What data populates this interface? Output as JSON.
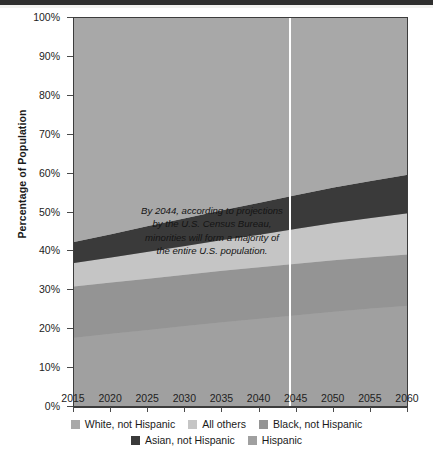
{
  "chart_data": {
    "type": "area",
    "title": "",
    "subtitle": "",
    "xlabel": "",
    "ylabel": "Percentage of Population",
    "xlim": [
      2015,
      2060
    ],
    "ylim": [
      0,
      100
    ],
    "stacked": true,
    "stack_order_top_to_bottom": [
      "White, not Hispanic",
      "Asian, not Hispanic",
      "All others",
      "Black, not Hispanic",
      "Hispanic"
    ],
    "grid": false,
    "legend_position": "bottom",
    "x": [
      2015,
      2020,
      2025,
      2030,
      2035,
      2040,
      2045,
      2050,
      2055,
      2060
    ],
    "xticklabels": [
      "2015",
      "2020",
      "2025",
      "2030",
      "2035",
      "2040",
      "2045",
      "2050",
      "2055",
      "2060"
    ],
    "yticklabels": [
      "0%",
      "10%",
      "20%",
      "30%",
      "40%",
      "50%",
      "60%",
      "70%",
      "80%",
      "90%",
      "100%"
    ],
    "yticks": [
      0,
      10,
      20,
      30,
      40,
      50,
      60,
      70,
      80,
      90,
      100
    ],
    "series": [
      {
        "name": "Hispanic",
        "color": "#a0a0a0",
        "values": [
          17.8,
          18.8,
          19.8,
          20.8,
          21.8,
          22.7,
          23.6,
          24.5,
          25.3,
          26.0
        ]
      },
      {
        "name": "Black, not Hispanic",
        "color": "#949494",
        "values": [
          13.2,
          13.2,
          13.2,
          13.2,
          13.2,
          13.2,
          13.2,
          13.2,
          13.2,
          13.2
        ]
      },
      {
        "name": "All others",
        "color": "#c5c5c5",
        "values": [
          6.0,
          6.4,
          6.9,
          7.4,
          7.9,
          8.4,
          9.0,
          9.6,
          10.1,
          10.6
        ]
      },
      {
        "name": "Asian, not Hispanic",
        "color": "#3a3a3a",
        "values": [
          5.4,
          6.0,
          6.6,
          7.1,
          7.7,
          8.2,
          8.7,
          9.1,
          9.5,
          9.9
        ]
      },
      {
        "name": "White, not Hispanic",
        "color": "#a8a8a8",
        "values": [
          57.6,
          55.6,
          53.5,
          51.5,
          49.4,
          47.5,
          45.5,
          43.6,
          41.9,
          40.3
        ]
      }
    ],
    "cumulative_top_boundaries": {
      "description": "Cumulative stacked top-edge percentage by year for each band boundary (bottom-up)",
      "hispanic_top": [
        17.8,
        18.8,
        19.8,
        20.8,
        21.8,
        22.7,
        23.6,
        24.5,
        25.3,
        26.0
      ],
      "black_top": [
        31.0,
        32.0,
        33.0,
        34.0,
        35.0,
        35.9,
        36.8,
        37.7,
        38.5,
        39.2
      ],
      "all_others_top": [
        37.0,
        38.4,
        39.9,
        41.4,
        42.9,
        44.3,
        45.8,
        47.3,
        48.6,
        49.8
      ],
      "asian_top": [
        42.4,
        44.4,
        46.5,
        48.5,
        50.6,
        52.5,
        54.5,
        56.4,
        58.1,
        59.7
      ],
      "white_top": [
        100,
        100,
        100,
        100,
        100,
        100,
        100,
        100,
        100,
        100
      ]
    },
    "annotation": {
      "lines": [
        "By 2044, according to projections",
        "by the U.S. Census Bureau,",
        "minorities will form a majority of",
        "the entire U.S. population."
      ],
      "marker_year": 2044
    }
  },
  "axes": {
    "y_title": "Percentage of Population",
    "y_ticks": [
      "100%",
      "90%",
      "80%",
      "70%",
      "60%",
      "50%",
      "40%",
      "30%",
      "20%",
      "10%",
      "0%"
    ],
    "x_ticks": [
      "2015",
      "2020",
      "2025",
      "2030",
      "2035",
      "2040",
      "2045",
      "2050",
      "2055",
      "2060"
    ]
  },
  "annotation_text": {
    "line1": "By 2044, according to projections",
    "line2": "by the U.S. Census Bureau,",
    "line3": "minorities will form a majority of",
    "line4": "the entire U.S. population."
  },
  "legend": {
    "row1": [
      {
        "label": "White, not Hispanic",
        "color": "#a8a8a8"
      },
      {
        "label": "All others",
        "color": "#c5c5c5"
      },
      {
        "label": "Black, not Hispanic",
        "color": "#949494"
      }
    ],
    "row2": [
      {
        "label": "Asian, not Hispanic",
        "color": "#3a3a3a"
      },
      {
        "label": "Hispanic",
        "color": "#a0a0a0"
      }
    ]
  },
  "colors": {
    "white_not_hispanic": "#a8a8a8",
    "asian_not_hispanic": "#3a3a3a",
    "all_others": "#c5c5c5",
    "black_not_hispanic": "#949494",
    "hispanic": "#a0a0a0",
    "marker_line": "#ffffff",
    "axis": "#3c3c3c",
    "background": "#ffffff"
  }
}
